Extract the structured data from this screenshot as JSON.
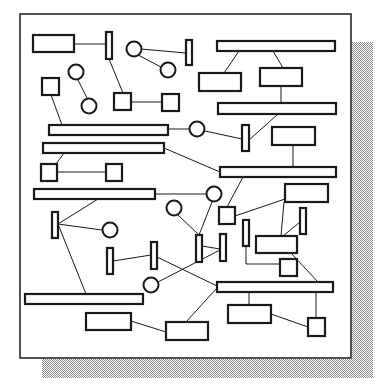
{
  "diagram": {
    "title": "",
    "colors": {
      "stroke": "#1a1a1a",
      "fill": "#ffffff",
      "shadow_dot": "#9a9a9a",
      "background": "#ffffff"
    },
    "frame": {
      "x": 20,
      "y": 14,
      "w": 331,
      "h": 344
    },
    "shadow": {
      "right": {
        "x": 352,
        "y": 42,
        "w": 21,
        "h": 336
      },
      "bottom": {
        "x": 42,
        "y": 359,
        "w": 331,
        "h": 19
      }
    },
    "rects": [
      {
        "id": "r1",
        "x": 33,
        "y": 35,
        "w": 41,
        "h": 17
      },
      {
        "id": "r2",
        "x": 106,
        "y": 32,
        "w": 6,
        "h": 27
      },
      {
        "id": "r3",
        "x": 186,
        "y": 40,
        "w": 6,
        "h": 25
      },
      {
        "id": "r4",
        "x": 217,
        "y": 41,
        "w": 118,
        "h": 10
      },
      {
        "id": "r5",
        "x": 199,
        "y": 73,
        "w": 42,
        "h": 18
      },
      {
        "id": "r6",
        "x": 260,
        "y": 68,
        "w": 42,
        "h": 18
      },
      {
        "id": "r7",
        "x": 42,
        "y": 78,
        "w": 17,
        "h": 17
      },
      {
        "id": "r8",
        "x": 114,
        "y": 93,
        "w": 17,
        "h": 17
      },
      {
        "id": "r9",
        "x": 162,
        "y": 94,
        "w": 17,
        "h": 17
      },
      {
        "id": "r10",
        "x": 218,
        "y": 103,
        "w": 118,
        "h": 11
      },
      {
        "id": "r11",
        "x": 49,
        "y": 125,
        "w": 119,
        "h": 10
      },
      {
        "id": "r12",
        "x": 242,
        "y": 125,
        "w": 7,
        "h": 26
      },
      {
        "id": "r13",
        "x": 272,
        "y": 127,
        "w": 43,
        "h": 18
      },
      {
        "id": "r14",
        "x": 43,
        "y": 143,
        "w": 121,
        "h": 10
      },
      {
        "id": "r15",
        "x": 220,
        "y": 167,
        "w": 116,
        "h": 10
      },
      {
        "id": "r16",
        "x": 41,
        "y": 164,
        "w": 16,
        "h": 17
      },
      {
        "id": "r17",
        "x": 106,
        "y": 164,
        "w": 16,
        "h": 17
      },
      {
        "id": "r18",
        "x": 285,
        "y": 184,
        "w": 43,
        "h": 18
      },
      {
        "id": "r19",
        "x": 34,
        "y": 189,
        "w": 121,
        "h": 10
      },
      {
        "id": "r20",
        "x": 219,
        "y": 207,
        "w": 16,
        "h": 17
      },
      {
        "id": "r21",
        "x": 300,
        "y": 208,
        "w": 6,
        "h": 26
      },
      {
        "id": "r22",
        "x": 52,
        "y": 212,
        "w": 6,
        "h": 26
      },
      {
        "id": "r23",
        "x": 243,
        "y": 220,
        "w": 6,
        "h": 26
      },
      {
        "id": "r24",
        "x": 256,
        "y": 236,
        "w": 41,
        "h": 17
      },
      {
        "id": "r25",
        "x": 107,
        "y": 248,
        "w": 6,
        "h": 26
      },
      {
        "id": "r26",
        "x": 151,
        "y": 242,
        "w": 6,
        "h": 27
      },
      {
        "id": "r27",
        "x": 196,
        "y": 235,
        "w": 6,
        "h": 27
      },
      {
        "id": "r28",
        "x": 220,
        "y": 234,
        "w": 6,
        "h": 27
      },
      {
        "id": "r29",
        "x": 280,
        "y": 259,
        "w": 17,
        "h": 17
      },
      {
        "id": "r30",
        "x": 217,
        "y": 282,
        "w": 116,
        "h": 10
      },
      {
        "id": "r31",
        "x": 25,
        "y": 294,
        "w": 118,
        "h": 10
      },
      {
        "id": "r32",
        "x": 86,
        "y": 313,
        "w": 45,
        "h": 17
      },
      {
        "id": "r33",
        "x": 228,
        "y": 305,
        "w": 43,
        "h": 18
      },
      {
        "id": "r34",
        "x": 166,
        "y": 322,
        "w": 42,
        "h": 18
      },
      {
        "id": "r35",
        "x": 308,
        "y": 318,
        "w": 17,
        "h": 18
      }
    ],
    "circles": [
      {
        "id": "c1",
        "cx": 134,
        "cy": 49,
        "r": 7.5
      },
      {
        "id": "c2",
        "cx": 168,
        "cy": 70,
        "r": 7.5
      },
      {
        "id": "c3",
        "cx": 76,
        "cy": 72,
        "r": 7.5
      },
      {
        "id": "c4",
        "cx": 89,
        "cy": 106,
        "r": 7.5
      },
      {
        "id": "c5",
        "cx": 197,
        "cy": 129,
        "r": 7.5
      },
      {
        "id": "c6",
        "cx": 214,
        "cy": 194,
        "r": 7.5
      },
      {
        "id": "c7",
        "cx": 174,
        "cy": 208,
        "r": 7.5
      },
      {
        "id": "c8",
        "cx": 110,
        "cy": 230,
        "r": 7.5
      },
      {
        "id": "c9",
        "cx": 151,
        "cy": 285,
        "r": 7.5
      }
    ],
    "lines": [
      [
        74,
        44,
        106,
        44
      ],
      [
        109,
        59,
        123,
        93
      ],
      [
        141,
        49,
        186,
        53
      ],
      [
        138,
        55,
        161,
        67
      ],
      [
        78,
        80,
        87,
        98
      ],
      [
        51,
        95,
        62,
        125
      ],
      [
        131,
        102,
        162,
        102
      ],
      [
        239,
        51,
        224,
        73
      ],
      [
        273,
        51,
        283,
        68
      ],
      [
        281,
        86,
        281,
        103
      ],
      [
        278,
        114,
        249,
        140
      ],
      [
        168,
        129,
        189,
        129
      ],
      [
        205,
        131,
        242,
        139
      ],
      [
        293,
        145,
        293,
        167
      ],
      [
        164,
        148,
        220,
        172
      ],
      [
        64,
        153,
        56,
        164
      ],
      [
        57,
        172,
        106,
        172
      ],
      [
        155,
        194,
        206,
        194
      ],
      [
        243,
        177,
        227,
        207
      ],
      [
        235,
        216,
        285,
        199
      ],
      [
        284,
        202,
        281,
        236
      ],
      [
        300,
        222,
        283,
        236
      ],
      [
        246,
        246,
        246,
        264
      ],
      [
        246,
        264,
        280,
        264
      ],
      [
        291,
        253,
        318,
        282
      ],
      [
        58,
        224,
        98,
        199
      ],
      [
        58,
        224,
        102,
        230
      ],
      [
        58,
        224,
        86,
        294
      ],
      [
        113,
        261,
        151,
        255
      ],
      [
        157,
        257,
        217,
        286
      ],
      [
        212,
        202,
        199,
        235
      ],
      [
        178,
        215,
        199,
        235
      ],
      [
        202,
        246,
        220,
        249
      ],
      [
        220,
        250,
        158,
        282
      ],
      [
        217,
        288,
        186,
        322
      ],
      [
        131,
        321,
        166,
        332
      ],
      [
        249,
        292,
        249,
        305
      ],
      [
        316,
        292,
        316,
        318
      ],
      [
        271,
        314,
        308,
        327
      ]
    ]
  }
}
